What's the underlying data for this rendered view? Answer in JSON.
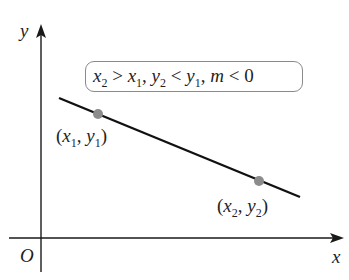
{
  "figure": {
    "axes": {
      "x_label": "x",
      "y_label": "y",
      "origin_label": "O"
    },
    "condition": {
      "x2": "x",
      "x2_sub": "2",
      "gt": " > ",
      "x1": "x",
      "x1_sub": "1",
      "sep1": ", ",
      "y2": "y",
      "y2_sub": "2",
      "lt": " < ",
      "y1": "y",
      "y1_sub": "1",
      "sep2": ", ",
      "m": "m",
      "lt2": " < ",
      "zero": "0"
    },
    "point1": {
      "open": "(",
      "x": "x",
      "x_sub": "1",
      "comma": ", ",
      "y": "y",
      "y_sub": "1",
      "close": ")"
    },
    "point2": {
      "open": "(",
      "x": "x",
      "x_sub": "2",
      "comma": ", ",
      "y": "y",
      "y_sub": "2",
      "close": ")"
    },
    "colors": {
      "axis": "#1a1a1a",
      "line": "#111111",
      "point": "#8c8c8c",
      "box_border": "#8a8a8a"
    }
  }
}
